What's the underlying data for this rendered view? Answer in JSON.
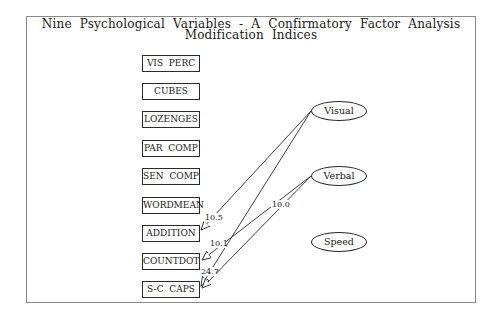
{
  "title": {
    "line1": "Nine  Psychological  Variables  -  A  Confirmatory  Factor  Analysis",
    "line2": "Modification  Indices"
  },
  "indicators": [
    {
      "label": "VIS  PERC"
    },
    {
      "label": "CUBES"
    },
    {
      "label": "LOZENGES"
    },
    {
      "label": "PAR  COMP"
    },
    {
      "label": "SEN  COMP"
    },
    {
      "label": "WORDMEAN"
    },
    {
      "label": "ADDITION"
    },
    {
      "label": "COUNTDOT"
    },
    {
      "label": "S-C  CAPS"
    }
  ],
  "factors": [
    {
      "label": "Visual"
    },
    {
      "label": "Verbal"
    },
    {
      "label": "Speed"
    }
  ],
  "paths": [
    {
      "from": "Visual",
      "to": "ADDITION",
      "index": "10.5"
    },
    {
      "from": "Verbal",
      "to": "COUNTDOT",
      "index": "10.1"
    },
    {
      "from": "Visual",
      "to": "S-C CAPS",
      "index": "24.7"
    },
    {
      "from": "Verbal",
      "to": "S-C CAPS",
      "index": "10.0"
    }
  ],
  "colors": {
    "line": "#2a2a2a",
    "frame": "#8a8a8a",
    "background": "#ffffff"
  }
}
